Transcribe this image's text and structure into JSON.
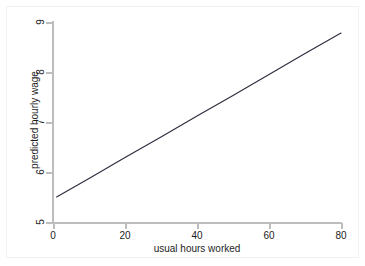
{
  "chart_data": {
    "type": "line",
    "title": "",
    "xlabel": "usual hours worked",
    "ylabel": "predicted hourly wage",
    "xlim": [
      0,
      82
    ],
    "ylim": [
      4.9,
      9.05
    ],
    "xticks": [
      0,
      20,
      40,
      60,
      80
    ],
    "xticklabels": [
      "0",
      "20",
      "40",
      "60",
      "80"
    ],
    "yticks": [
      5,
      6,
      7,
      8,
      9
    ],
    "yticklabels": [
      "5",
      "6",
      "7",
      "8",
      "9"
    ],
    "grid": false,
    "legend": "none",
    "series": [
      {
        "name": "predicted hourly wage",
        "color": "#2b2b3c",
        "x": [
          1,
          10,
          20,
          30,
          40,
          50,
          60,
          70,
          80
        ],
        "y": [
          5.5,
          5.87,
          6.29,
          6.7,
          7.12,
          7.53,
          7.95,
          8.37,
          8.78
        ]
      }
    ],
    "line_endpoints": {
      "start": {
        "x": 1,
        "y": 5.5
      },
      "end": {
        "x": 80,
        "y": 8.78
      }
    },
    "slope_per_hour": 0.0415,
    "intercept": 5.46
  },
  "axes": {
    "x_title": "usual hours worked",
    "y_title": "predicted hourly wage"
  },
  "style": {
    "background": "#ffffff",
    "plot_background": "#ffffff",
    "axis_color": "#bdbdbd",
    "tick_label_color": "#1d1d1d",
    "line_color": "#2b2b3c",
    "frame_color": "#f2f2f2"
  }
}
